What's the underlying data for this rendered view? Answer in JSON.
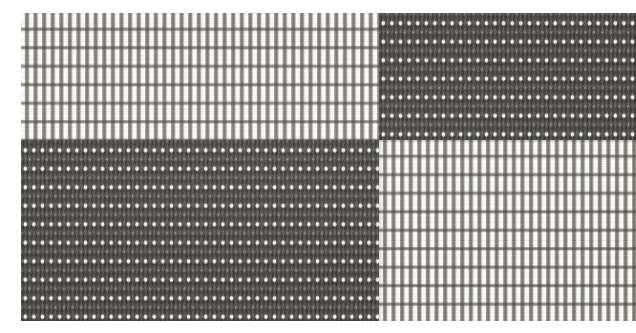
{
  "image": {
    "subject": "woven textile macro photograph",
    "description": "Close-up macro photograph of a plain-woven ribbed fabric showing a four-quadrant checkerboard of two weave tones",
    "width_px": 636,
    "height_px": 333,
    "orientation": "landscape",
    "capture_style": "flat-lay macro, diffuse frontal lighting",
    "background_color": "#ffffff"
  },
  "swatch": {
    "label": "fabric swatch",
    "left_px": 21,
    "top_px": 13,
    "width_px": 615,
    "height_px": 308,
    "vertical_split_px": 379,
    "horizontal_split_px": 140
  },
  "weave": {
    "structure": "plain weave with floating weft dots",
    "warp_direction": "vertical",
    "weft_direction": "horizontal",
    "warp_pitch_px": 8.6,
    "weft_pitch_px": 18.5,
    "warp_threads_visible": 71,
    "weft_rows_visible": 17
  },
  "palette": {
    "light_ground": "#efeeea",
    "light_warp": "#706c65",
    "light_weft_line": "#46423e",
    "dark_ground": "#4e4b46",
    "dark_shadow": "#2f2d29",
    "dot_highlight": "#ffffff",
    "paper_white": "#ffffff"
  },
  "quadrants": [
    {
      "id": "top-left",
      "name": "upper-left-light-block",
      "tone": "light",
      "weave_class": "weave-light",
      "left_px": 0,
      "top_px": 0,
      "width_px": 358,
      "height_px": 127,
      "mean_luminance": 0.71
    },
    {
      "id": "top-right",
      "name": "upper-right-dark-block",
      "tone": "dark",
      "weave_class": "weave-dark",
      "left_px": 358,
      "top_px": 0,
      "width_px": 257,
      "height_px": 127,
      "mean_luminance": 0.34
    },
    {
      "id": "bottom-left",
      "name": "lower-left-dark-block",
      "tone": "dark",
      "weave_class": "weave-dark",
      "left_px": 0,
      "top_px": 127,
      "width_px": 358,
      "height_px": 181,
      "mean_luminance": 0.33
    },
    {
      "id": "bottom-right",
      "name": "lower-right-light-block",
      "tone": "light",
      "weave_class": "weave-light",
      "left_px": 358,
      "top_px": 127,
      "width_px": 257,
      "height_px": 181,
      "mean_luminance": 0.74
    }
  ],
  "seams": [
    {
      "id": "vertical-seam",
      "orientation": "vertical",
      "position_px": 358
    },
    {
      "id": "horizontal-seam-left",
      "orientation": "horizontal",
      "position_px": 127,
      "span": "left"
    },
    {
      "id": "horizontal-seam-right",
      "orientation": "horizontal",
      "position_px": 127,
      "span": "right"
    }
  ]
}
